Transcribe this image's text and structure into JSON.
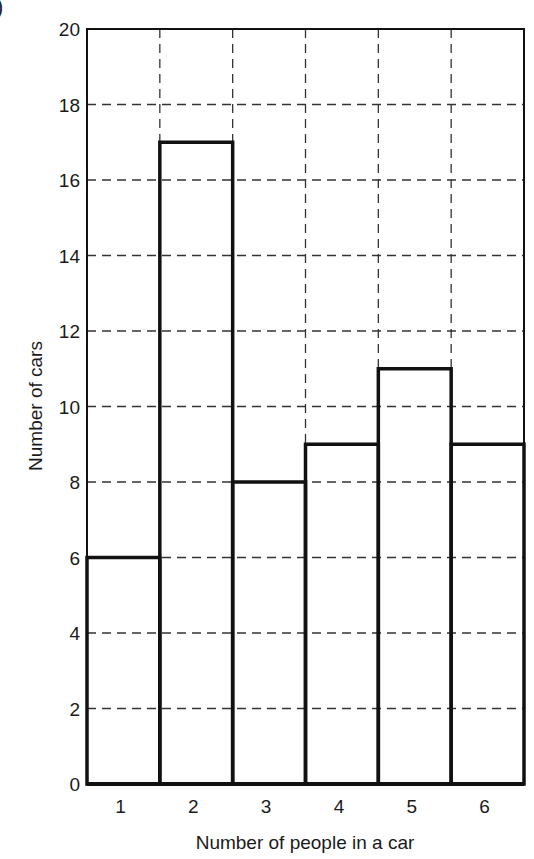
{
  "corner_label": ")",
  "chart_data": {
    "type": "bar",
    "title": "",
    "xlabel": "Number of people in a car",
    "ylabel": "Number of cars",
    "categories": [
      "1",
      "2",
      "3",
      "4",
      "5",
      "6"
    ],
    "values": [
      6,
      17,
      8,
      9,
      11,
      9
    ],
    "ylim": [
      0,
      20
    ],
    "yticks": [
      0,
      2,
      4,
      6,
      8,
      10,
      12,
      14,
      16,
      18,
      20
    ],
    "grid": true,
    "grid_style": "dashed",
    "legend": null,
    "bar_fill": "#ffffff",
    "bar_edge": "#111111"
  }
}
